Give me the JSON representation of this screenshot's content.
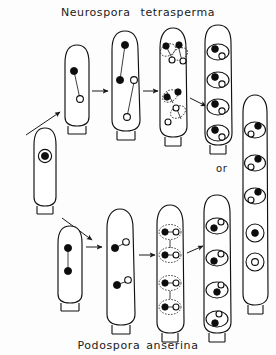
{
  "figure": {
    "title_top": {
      "genus": "Neurospora",
      "species": "tetrasperma"
    },
    "title_bottom": {
      "genus": "Podospora",
      "species": "anserina"
    },
    "or_label": "or",
    "background_color": "#fdfdfd",
    "ink_color": "#111111",
    "nucleus_dark_color": "#0d0d0d",
    "nucleus_light_color": "#ffffff"
  },
  "diagram": {
    "start_cell": {
      "name": "zygote",
      "nuclei": [
        {
          "type": "ringed",
          "x": 0,
          "y": 0
        }
      ]
    },
    "rows": [
      {
        "id": "neurospora-tetrasperma",
        "label": "Neurospora tetrasperma",
        "stages": [
          {
            "stage": 1,
            "name": "two-nucleus-ascus",
            "nuclei": [
              {
                "type": "dark"
              },
              {
                "type": "light"
              }
            ],
            "spindles": 1,
            "spores": 0
          },
          {
            "stage": 2,
            "name": "four-nucleus-ascus",
            "nuclei": [
              {
                "type": "dark"
              },
              {
                "type": "dark"
              },
              {
                "type": "light"
              },
              {
                "type": "light"
              }
            ],
            "spindles": 2,
            "spores": 0
          },
          {
            "stage": 3,
            "name": "eight-nucleus-delimiting-ascus",
            "nuclei": [
              {
                "type": "dark"
              },
              {
                "type": "dark"
              },
              {
                "type": "light"
              },
              {
                "type": "light"
              },
              {
                "type": "dark"
              },
              {
                "type": "dark"
              },
              {
                "type": "light"
              },
              {
                "type": "light"
              }
            ],
            "spindles": 4,
            "spores": 4,
            "spore_envelope": "dashed"
          },
          {
            "stage": 4,
            "name": "four-binucleate-spores-ascus",
            "spores": 4,
            "spore_contents": [
              {
                "dark": 1,
                "light": 1
              },
              {
                "dark": 1,
                "light": 1
              },
              {
                "dark": 1,
                "light": 1
              },
              {
                "dark": 1,
                "light": 1
              }
            ],
            "spore_envelope": "solid"
          },
          {
            "stage": 5,
            "name": "alternative-five-spore-ascus",
            "alternative": true,
            "spores": 5,
            "spore_contents": [
              {
                "dark": 1,
                "light": 1
              },
              {
                "dark": 1,
                "light": 1
              },
              {
                "dark": 1,
                "light": 1
              },
              {
                "dark": 1,
                "light": 0
              },
              {
                "dark": 0,
                "light": 1
              }
            ],
            "spore_envelope": "solid"
          }
        ]
      },
      {
        "id": "podospora-anserina",
        "label": "Podospora anserina",
        "stages": [
          {
            "stage": 1,
            "name": "two-nucleus-ascus",
            "nuclei": [
              {
                "type": "dark"
              },
              {
                "type": "dark"
              }
            ],
            "spindles": 1,
            "spores": 0
          },
          {
            "stage": 2,
            "name": "four-nucleus-ascus",
            "nuclei": [
              {
                "type": "dark"
              },
              {
                "type": "light"
              },
              {
                "type": "dark"
              },
              {
                "type": "light"
              }
            ],
            "spindles": 2,
            "spores": 0
          },
          {
            "stage": 3,
            "name": "eight-nucleus-delimiting-ascus",
            "nuclei": [
              {
                "type": "dark"
              },
              {
                "type": "light"
              },
              {
                "type": "dark"
              },
              {
                "type": "light"
              },
              {
                "type": "dark"
              },
              {
                "type": "light"
              },
              {
                "type": "dark"
              },
              {
                "type": "light"
              }
            ],
            "spindles": 4,
            "spores": 4,
            "spore_envelope": "dashed"
          },
          {
            "stage": 4,
            "name": "four-binucleate-spores-ascus",
            "spores": 4,
            "spore_contents": [
              {
                "dark": 1,
                "light": 1
              },
              {
                "dark": 1,
                "light": 1
              },
              {
                "dark": 1,
                "light": 1
              },
              {
                "dark": 1,
                "light": 1
              }
            ],
            "spore_envelope": "solid"
          }
        ]
      }
    ],
    "arrows": [
      {
        "from": "zygote",
        "to": "neurospora-stage-1",
        "direction": "up-right"
      },
      {
        "from": "zygote",
        "to": "podospora-stage-1",
        "direction": "down-right"
      },
      {
        "from": "neurospora-stage-1",
        "to": "neurospora-stage-2",
        "direction": "right"
      },
      {
        "from": "neurospora-stage-2",
        "to": "neurospora-stage-3",
        "direction": "right"
      },
      {
        "from": "neurospora-stage-3",
        "to": "neurospora-stage-4",
        "direction": "down-right"
      },
      {
        "from": "podospora-stage-1",
        "to": "podospora-stage-2",
        "direction": "right"
      },
      {
        "from": "podospora-stage-2",
        "to": "podospora-stage-3",
        "direction": "right"
      },
      {
        "from": "podospora-stage-3",
        "to": "podospora-stage-4",
        "direction": "up-right"
      }
    ]
  }
}
